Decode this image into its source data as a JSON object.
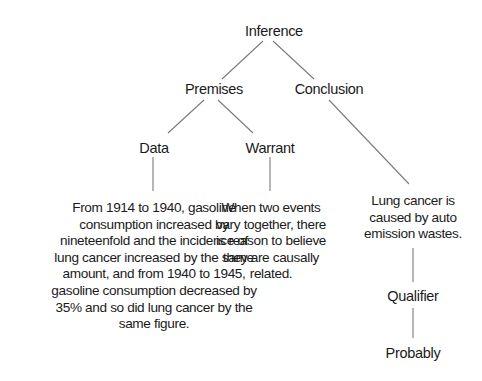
{
  "diagram": {
    "type": "tree",
    "title": "Inference",
    "nodes": {
      "inference": "Inference",
      "premises": "Premises",
      "conclusion": "Conclusion",
      "data": "Data",
      "warrant": "Warrant",
      "qualifier": "Qualifier",
      "probably": "Probably"
    },
    "data_text": [
      "From 1914 to 1940, gasoline",
      "consumption increased by",
      "nineteenfold and the incidence of",
      "lung cancer increased by the same",
      "amount, and from 1940 to 1945,",
      "gasoline consumption decreased by",
      "35% and so did lung cancer by the",
      "same figure."
    ],
    "warrant_text": [
      "When two events",
      "vary together, there",
      "is reason to believe",
      "they are causally",
      "related."
    ],
    "conclusion_text": [
      "Lung cancer is",
      "caused by auto",
      "emission wastes."
    ],
    "edges": [
      [
        "inference",
        "premises"
      ],
      [
        "inference",
        "conclusion"
      ],
      [
        "premises",
        "data"
      ],
      [
        "premises",
        "warrant"
      ],
      [
        "data",
        "data_text"
      ],
      [
        "warrant",
        "warrant_text"
      ],
      [
        "conclusion",
        "conclusion_text"
      ],
      [
        "conclusion_text",
        "qualifier"
      ],
      [
        "qualifier",
        "probably"
      ]
    ]
  }
}
